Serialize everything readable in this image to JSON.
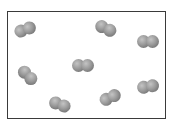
{
  "diagram": {
    "container": {
      "x": 7,
      "y": 11,
      "width": 159,
      "height": 108,
      "border_color": "#3a3a3a"
    },
    "atom_color": "#8c8c8c",
    "molecules": [
      {
        "id": 1,
        "cx": 25,
        "cy": 29,
        "angle": -20
      },
      {
        "id": 2,
        "cx": 106,
        "cy": 28,
        "angle": 25
      },
      {
        "id": 3,
        "cx": 148,
        "cy": 41,
        "angle": 0
      },
      {
        "id": 4,
        "cx": 28,
        "cy": 75,
        "angle": 45
      },
      {
        "id": 5,
        "cx": 83,
        "cy": 65,
        "angle": 0
      },
      {
        "id": 6,
        "cx": 60,
        "cy": 104,
        "angle": 20
      },
      {
        "id": 7,
        "cx": 110,
        "cy": 97,
        "angle": -25
      },
      {
        "id": 8,
        "cx": 148,
        "cy": 86,
        "angle": -10
      }
    ]
  }
}
